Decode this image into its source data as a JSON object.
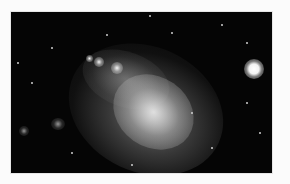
{
  "image": {
    "subject": "irregular dwarf galaxy with foreground star",
    "alt": "Astronomical photograph of an irregular galaxy (resembling the Small Magellanic Cloud) against a black star field, with a bright star at upper right",
    "colors": {
      "page_background": "#fbfbfb",
      "sky": "#050505",
      "galaxy": "#d9d9d9",
      "star": "#ffffff"
    }
  }
}
